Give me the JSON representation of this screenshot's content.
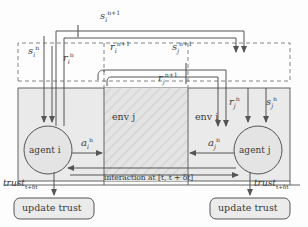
{
  "diagram": {
    "colors": {
      "line": "#555555",
      "dashed": "#777777",
      "env_fill": "#e9e9e9",
      "hatch_fill": "#dcdcdc",
      "node_fill": "#e4e4e4",
      "text": "#3a3a3a"
    },
    "nodes": {
      "agent_i": "agent i",
      "agent_j": "agent j",
      "env_j": "env j",
      "env_i": "env i",
      "update_trust_left": "update trust",
      "update_trust_right": "update trust"
    },
    "signals": {
      "s_i_np1": {
        "base": "s",
        "sub": "i",
        "sup": "n+1"
      },
      "s_i_n": {
        "base": "s",
        "sub": "i",
        "sup": "n"
      },
      "r_i_n": {
        "base": "r",
        "sub": "i",
        "sup": "n"
      },
      "r_i_np1": {
        "base": "r",
        "sub": "i",
        "sup": "n+1"
      },
      "s_j_np1": {
        "base": "s",
        "sub": "j",
        "sup": "n+1"
      },
      "r_j_np1": {
        "base": "r",
        "sub": "j",
        "sup": "n+1"
      },
      "r_j_n": {
        "base": "r",
        "sub": "j",
        "sup": "n"
      },
      "s_j_n": {
        "base": "s",
        "sub": "j",
        "sup": "n"
      },
      "a_i_n": {
        "base": "a",
        "sub": "i",
        "sup": "n"
      },
      "a_j_n": {
        "base": "a",
        "sub": "j",
        "sup": "n"
      }
    },
    "annotations": {
      "interaction": "interaction at [t, t + δt]",
      "trust_left_base": "trust",
      "trust_left_sub": "t+δt",
      "trust_right_base": "trust",
      "trust_right_sub": "t+δt"
    }
  }
}
